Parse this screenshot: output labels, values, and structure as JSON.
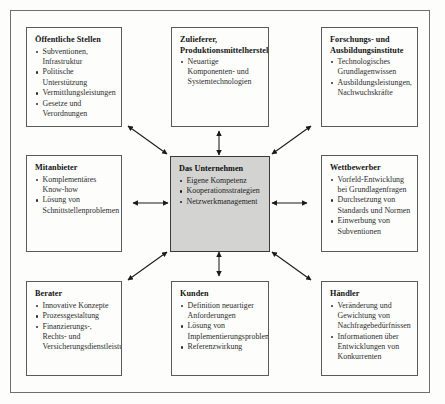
{
  "diagram": {
    "center_fill_color": "#d3d3d1",
    "box_border_color": "#5a5a5a",
    "frame_color": "#6e6e6e",
    "arrow_color": "#1a1a1a"
  },
  "boxes": [
    {
      "id": "oeffentliche-stellen",
      "position": "top-left",
      "title": "Öffentliche Stellen",
      "items": [
        "Subventionen, Infrastruktur",
        "Politische Unterstützung",
        "Vermittlungsleistungen",
        "Gesetze und Verordnungen"
      ]
    },
    {
      "id": "zulieferer",
      "position": "top-center",
      "title": "Zulieferer, Produktionsmittelhersteller",
      "items": [
        "Neuartige Komponenten- und Systemtechnologien"
      ]
    },
    {
      "id": "forschungsinstitute",
      "position": "top-right",
      "title": "Forschungs- und Ausbildungsinstitute",
      "items": [
        "Technologisches Grundlagenwissen",
        "Ausbildungsleistungen, Nachwuchskräfte"
      ]
    },
    {
      "id": "mitanbieter",
      "position": "middle-left",
      "title": "Mitanbieter",
      "items": [
        "Komplementäres Know-how",
        "Lösung von Schnittstellenproblemen"
      ]
    },
    {
      "id": "das-unternehmen",
      "position": "center",
      "title": "Das Unternehmen",
      "items": [
        "Eigene Kompetenz",
        "Kooperationsstrategien",
        "Netzwerkmanagement"
      ]
    },
    {
      "id": "wettbewerber",
      "position": "middle-right",
      "title": "Wettbewerber",
      "items": [
        "Vorfeld-Entwicklung bei Grundlagenfragen",
        "Durchsetzung von Standards und Normen",
        "Einwerbung von Subventionen"
      ]
    },
    {
      "id": "berater",
      "position": "bottom-left",
      "title": "Berater",
      "items": [
        "Innovative Konzepte",
        "Prozessgestaltung",
        "Finanzierungs-, Rechts- und Versicherungsdienstleistung"
      ]
    },
    {
      "id": "kunden",
      "position": "bottom-center",
      "title": "Kunden",
      "items": [
        "Definition neuartiger Anforderungen",
        "Lösung von Implementierungsproblemen",
        "Referenzwirkung"
      ]
    },
    {
      "id": "haendler",
      "position": "bottom-right",
      "title": "Händler",
      "items": [
        "Veränderung und Gewichtung von Nachfragebedürfnissen",
        "Informationen über Entwicklungen von Konkurrenten"
      ]
    }
  ],
  "connections": [
    {
      "from": "das-unternehmen",
      "to": "oeffentliche-stellen",
      "style": "double-headed-arrow",
      "orientation": "diagonal"
    },
    {
      "from": "das-unternehmen",
      "to": "zulieferer",
      "style": "double-headed-arrow",
      "orientation": "vertical"
    },
    {
      "from": "das-unternehmen",
      "to": "forschungsinstitute",
      "style": "double-headed-arrow",
      "orientation": "diagonal"
    },
    {
      "from": "das-unternehmen",
      "to": "mitanbieter",
      "style": "double-headed-arrow",
      "orientation": "horizontal"
    },
    {
      "from": "das-unternehmen",
      "to": "wettbewerber",
      "style": "double-headed-arrow",
      "orientation": "horizontal"
    },
    {
      "from": "das-unternehmen",
      "to": "berater",
      "style": "double-headed-arrow",
      "orientation": "diagonal"
    },
    {
      "from": "das-unternehmen",
      "to": "kunden",
      "style": "double-headed-arrow",
      "orientation": "vertical"
    },
    {
      "from": "das-unternehmen",
      "to": "haendler",
      "style": "double-headed-arrow",
      "orientation": "diagonal"
    }
  ]
}
